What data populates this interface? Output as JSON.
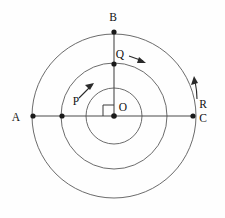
{
  "figure": {
    "background_color": "#fefefe",
    "line_color": "#5a5a5a",
    "label_color": "#111111",
    "width": 225,
    "height": 218
  },
  "geometry": {
    "center": {
      "x": 114,
      "y": 116
    },
    "circles": [
      {
        "name": "inner-circle",
        "radius": 28
      },
      {
        "name": "middle-circle",
        "radius": 53
      },
      {
        "name": "outer-circle",
        "radius": 82
      }
    ],
    "diameter_line": {
      "from": "A",
      "to": "C",
      "y": 116
    },
    "radius_line": {
      "from": "O",
      "to": "B"
    },
    "right_angle_marker": {
      "at": "O",
      "size": 11,
      "orientation": "upper-left"
    }
  },
  "points": [
    {
      "id": "A",
      "label": "A",
      "x": 33,
      "y": 116,
      "label_x": 20,
      "label_y": 118,
      "dot": true
    },
    {
      "id": "P",
      "label": "P",
      "x": 62,
      "y": 116,
      "label_x": 76,
      "label_y": 102,
      "dot": true
    },
    {
      "id": "O",
      "label": "O",
      "x": 114,
      "y": 116,
      "label_x": 122,
      "label_y": 108,
      "dot": true
    },
    {
      "id": "C",
      "label": "C",
      "x": 193,
      "y": 116,
      "label_x": 201,
      "label_y": 119,
      "dot": true
    },
    {
      "id": "Q",
      "label": "Q",
      "x": 114,
      "y": 64,
      "label_x": 118,
      "label_y": 54,
      "dot": true
    },
    {
      "id": "B",
      "label": "B",
      "x": 114,
      "y": 32,
      "label_x": 112,
      "label_y": 17,
      "dot": true
    },
    {
      "id": "R",
      "label": "R",
      "x": 196,
      "y": 98,
      "label_x": 201,
      "label_y": 105,
      "dot": false
    }
  ],
  "arrows": [
    {
      "id": "P-arrow",
      "name": "velocity-arrow-p",
      "description": "tangential direction at P, pointing up-right",
      "path": "M 79 98 L 93 84",
      "head": "93,84 86,86 89,91"
    },
    {
      "id": "Q-arrow",
      "name": "velocity-arrow-q",
      "description": "tangential direction at Q, pointing right and slightly down",
      "path": "M 129 56 L 144 62",
      "head": "146,63 138,62 140,57"
    },
    {
      "id": "R-arrow",
      "name": "velocity-arrow-r",
      "description": "tangential direction at R on outer circle, curving upward",
      "path": "M 197 99 C 197 92 196 86 195 80",
      "head": "194,76 192,84 198,83"
    }
  ],
  "labels": {
    "A": "A",
    "B": "B",
    "C": "C",
    "O": "O",
    "P": "P",
    "Q": "Q",
    "R": "R"
  }
}
